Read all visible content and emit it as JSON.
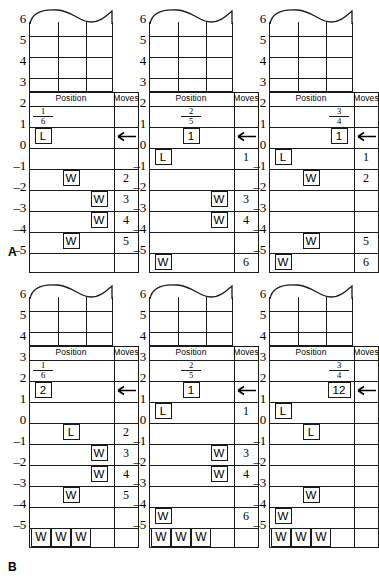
{
  "figure": {
    "group_labels": [
      {
        "text": "A"
      },
      {
        "text": "B"
      }
    ],
    "axis_ticks": [
      "6",
      "5",
      "4",
      "3",
      "2",
      "1",
      "0",
      "-1",
      "-2",
      "-3",
      "-4",
      "-5"
    ],
    "table_headers": {
      "position": "Position",
      "moves": "Moves"
    },
    "arrow_glyph": "left-arrow"
  },
  "chart_data": {
    "type": "table",
    "title": "",
    "panels": [
      {
        "group": "A",
        "index": 1,
        "fraction": {
          "numerator": "1",
          "denominator": "6"
        },
        "fraction_row": "2",
        "fraction_col": "1",
        "arrow_row": "1",
        "markers": [
          {
            "row": "1",
            "col": "1",
            "label": "L"
          },
          {
            "row": "-1",
            "col": "2",
            "label": "W"
          },
          {
            "row": "-2",
            "col": "3",
            "label": "W"
          },
          {
            "row": "-3",
            "col": "3",
            "label": "W"
          },
          {
            "row": "-4",
            "col": "2",
            "label": "W"
          }
        ],
        "moves": [
          {
            "row": "-1",
            "value": "2"
          },
          {
            "row": "-2",
            "value": "3"
          },
          {
            "row": "-3",
            "value": "4"
          },
          {
            "row": "-4",
            "value": "5"
          }
        ],
        "bottom_w": []
      },
      {
        "group": "A",
        "index": 2,
        "fraction": {
          "numerator": "2",
          "denominator": "5"
        },
        "fraction_row": "2",
        "fraction_col": "2",
        "arrow_row": "1",
        "markers": [
          {
            "row": "1",
            "col": "2",
            "label": "1"
          },
          {
            "row": "0",
            "col": "1",
            "label": "L"
          },
          {
            "row": "-2",
            "col": "3",
            "label": "W"
          },
          {
            "row": "-3",
            "col": "3",
            "label": "W"
          },
          {
            "row": "-5",
            "col": "1",
            "label": "W"
          }
        ],
        "moves": [
          {
            "row": "0",
            "value": "1"
          },
          {
            "row": "-2",
            "value": "3"
          },
          {
            "row": "-3",
            "value": "4"
          },
          {
            "row": "-5",
            "value": "6"
          }
        ],
        "bottom_w": []
      },
      {
        "group": "A",
        "index": 3,
        "fraction": {
          "numerator": "3",
          "denominator": "4"
        },
        "fraction_row": "2",
        "fraction_col": "3",
        "arrow_row": "1",
        "markers": [
          {
            "row": "1",
            "col": "3",
            "label": "1"
          },
          {
            "row": "0",
            "col": "1",
            "label": "L"
          },
          {
            "row": "-1",
            "col": "2",
            "label": "W"
          },
          {
            "row": "-4",
            "col": "2",
            "label": "W"
          },
          {
            "row": "-5",
            "col": "1",
            "label": "W"
          }
        ],
        "moves": [
          {
            "row": "0",
            "value": "1"
          },
          {
            "row": "-1",
            "value": "2"
          },
          {
            "row": "-4",
            "value": "5"
          },
          {
            "row": "-5",
            "value": "6"
          }
        ],
        "bottom_w": []
      },
      {
        "group": "B",
        "index": 1,
        "fraction": {
          "numerator": "1",
          "denominator": "6"
        },
        "fraction_row": "3",
        "fraction_col": "1",
        "arrow_row": "2",
        "markers": [
          {
            "row": "2",
            "col": "1",
            "label": "2"
          },
          {
            "row": "0",
            "col": "2",
            "label": "L"
          },
          {
            "row": "-1",
            "col": "3",
            "label": "W"
          },
          {
            "row": "-2",
            "col": "3",
            "label": "W"
          },
          {
            "row": "-3",
            "col": "2",
            "label": "W"
          }
        ],
        "moves": [
          {
            "row": "0",
            "value": "2"
          },
          {
            "row": "-1",
            "value": "3"
          },
          {
            "row": "-2",
            "value": "4"
          },
          {
            "row": "-3",
            "value": "5"
          }
        ],
        "bottom_w": [
          "W",
          "W",
          "W"
        ]
      },
      {
        "group": "B",
        "index": 2,
        "fraction": {
          "numerator": "2",
          "denominator": "5"
        },
        "fraction_row": "3",
        "fraction_col": "2",
        "arrow_row": "2",
        "markers": [
          {
            "row": "2",
            "col": "2",
            "label": "1"
          },
          {
            "row": "1",
            "col": "1",
            "label": "L"
          },
          {
            "row": "-1",
            "col": "3",
            "label": "W"
          },
          {
            "row": "-2",
            "col": "3",
            "label": "W"
          },
          {
            "row": "-4",
            "col": "1",
            "label": "W"
          }
        ],
        "moves": [
          {
            "row": "1",
            "value": "1"
          },
          {
            "row": "-1",
            "value": "3"
          },
          {
            "row": "-2",
            "value": "4"
          },
          {
            "row": "-4",
            "value": "6"
          }
        ],
        "bottom_w": [
          "W",
          "W",
          "W"
        ]
      },
      {
        "group": "B",
        "index": 3,
        "fraction": {
          "numerator": "3",
          "denominator": "4"
        },
        "fraction_row": "3",
        "fraction_col": "3",
        "arrow_row": "2",
        "markers": [
          {
            "row": "2",
            "col": "3",
            "label": "12",
            "wide": true
          },
          {
            "row": "1",
            "col": "1",
            "label": "L"
          },
          {
            "row": "0",
            "col": "2",
            "label": "L"
          },
          {
            "row": "-3",
            "col": "2",
            "label": "W"
          },
          {
            "row": "-4",
            "col": "1",
            "label": "W"
          }
        ],
        "moves": [],
        "bottom_w": [
          "W",
          "W",
          "W"
        ]
      }
    ]
  }
}
